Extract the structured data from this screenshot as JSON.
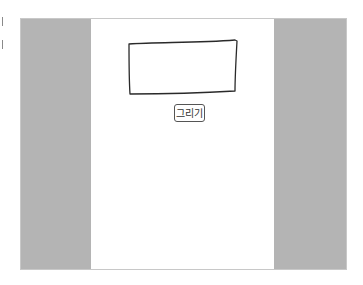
{
  "app": {
    "stage": {
      "side_panel_color": "#b4b4b4",
      "canvas_color": "#ffffff"
    },
    "drawing": {
      "shape": "hand-drawn rectangle",
      "stroke_color": "#2a2a2a"
    },
    "draw_button": {
      "label": "그리기"
    }
  }
}
